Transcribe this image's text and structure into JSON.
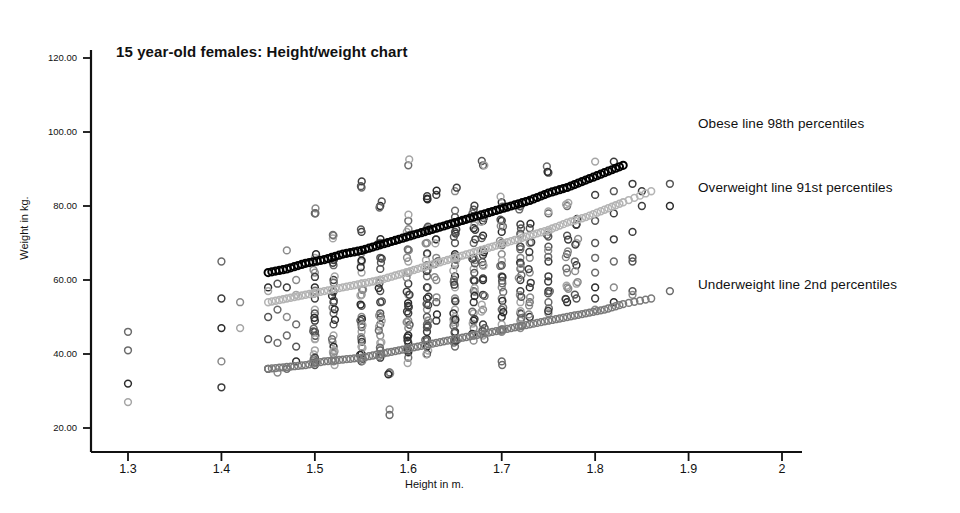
{
  "chart_data": {
    "type": "scatter",
    "title": "15 year-old females: Height/weight chart",
    "xlabel": "Height in m.",
    "ylabel": "Weight in kg.",
    "xlim": [
      1.25,
      2.02
    ],
    "ylim": [
      17.0,
      124.0
    ],
    "grid": false,
    "legend_position": "right-annotations",
    "xticks": [
      "1.3",
      "1.4",
      "1.5",
      "1.6",
      "1.7",
      "1.8",
      "1.9",
      "2"
    ],
    "xtick_values": [
      1.3,
      1.4,
      1.5,
      1.6,
      1.7,
      1.8,
      1.9,
      2.0
    ],
    "yticks": [
      "20.00",
      "40.00",
      "60.00",
      "80.00",
      "100.00",
      "120.00"
    ],
    "ytick_values": [
      20,
      40,
      60,
      80,
      100,
      120
    ],
    "marker": "open-circle",
    "annotations": [
      {
        "text": "Obese line 98th percentiles",
        "series": "obese-98th"
      },
      {
        "text": "Overweight line 91st percentiles",
        "series": "overweight-91st"
      },
      {
        "text": "Underweight line 2nd percentiles",
        "series": "underweight-2nd"
      }
    ],
    "series": [
      {
        "name": "observations",
        "role": "data-points",
        "color": "#3a3a3a",
        "points": [
          [
            1.3,
            46
          ],
          [
            1.3,
            41
          ],
          [
            1.3,
            32
          ],
          [
            1.3,
            27
          ],
          [
            1.4,
            65
          ],
          [
            1.4,
            55
          ],
          [
            1.4,
            47
          ],
          [
            1.4,
            38
          ],
          [
            1.4,
            31
          ],
          [
            1.42,
            54
          ],
          [
            1.42,
            47
          ],
          [
            1.45,
            58
          ],
          [
            1.45,
            57
          ],
          [
            1.45,
            50
          ],
          [
            1.45,
            44
          ],
          [
            1.45,
            36
          ],
          [
            1.46,
            59
          ],
          [
            1.46,
            52
          ],
          [
            1.46,
            43
          ],
          [
            1.46,
            35
          ],
          [
            1.47,
            68
          ],
          [
            1.47,
            58
          ],
          [
            1.47,
            50
          ],
          [
            1.47,
            45
          ],
          [
            1.47,
            36
          ],
          [
            1.48,
            60
          ],
          [
            1.48,
            56
          ],
          [
            1.48,
            48
          ],
          [
            1.48,
            42
          ],
          [
            1.48,
            38
          ],
          [
            1.5,
            78
          ],
          [
            1.5,
            66
          ],
          [
            1.5,
            62
          ],
          [
            1.5,
            58
          ],
          [
            1.5,
            55
          ],
          [
            1.5,
            52
          ],
          [
            1.5,
            49
          ],
          [
            1.5,
            46
          ],
          [
            1.5,
            44
          ],
          [
            1.5,
            41
          ],
          [
            1.5,
            39
          ],
          [
            1.5,
            37
          ],
          [
            1.52,
            72
          ],
          [
            1.52,
            64
          ],
          [
            1.52,
            60
          ],
          [
            1.52,
            57
          ],
          [
            1.52,
            54
          ],
          [
            1.52,
            51
          ],
          [
            1.52,
            48
          ],
          [
            1.52,
            45
          ],
          [
            1.52,
            42
          ],
          [
            1.52,
            40
          ],
          [
            1.52,
            38
          ],
          [
            1.55,
            85
          ],
          [
            1.55,
            73
          ],
          [
            1.55,
            68
          ],
          [
            1.55,
            65
          ],
          [
            1.55,
            62
          ],
          [
            1.55,
            59
          ],
          [
            1.55,
            56
          ],
          [
            1.55,
            53
          ],
          [
            1.55,
            50
          ],
          [
            1.55,
            48
          ],
          [
            1.55,
            46
          ],
          [
            1.55,
            44
          ],
          [
            1.55,
            42
          ],
          [
            1.55,
            40
          ],
          [
            1.55,
            38
          ],
          [
            1.57,
            80
          ],
          [
            1.57,
            70
          ],
          [
            1.57,
            66
          ],
          [
            1.57,
            63
          ],
          [
            1.57,
            60
          ],
          [
            1.57,
            57
          ],
          [
            1.57,
            54
          ],
          [
            1.57,
            51
          ],
          [
            1.57,
            48
          ],
          [
            1.57,
            45
          ],
          [
            1.57,
            43
          ],
          [
            1.57,
            41
          ],
          [
            1.57,
            39
          ],
          [
            1.58,
            25
          ],
          [
            1.58,
            35
          ],
          [
            1.6,
            91
          ],
          [
            1.6,
            76
          ],
          [
            1.6,
            72
          ],
          [
            1.6,
            68
          ],
          [
            1.6,
            65
          ],
          [
            1.6,
            62
          ],
          [
            1.6,
            59
          ],
          [
            1.6,
            56
          ],
          [
            1.6,
            53
          ],
          [
            1.6,
            51
          ],
          [
            1.6,
            49
          ],
          [
            1.6,
            47
          ],
          [
            1.6,
            45
          ],
          [
            1.6,
            43
          ],
          [
            1.6,
            41
          ],
          [
            1.6,
            39
          ],
          [
            1.62,
            82
          ],
          [
            1.62,
            74
          ],
          [
            1.62,
            70
          ],
          [
            1.62,
            67
          ],
          [
            1.62,
            64
          ],
          [
            1.62,
            61
          ],
          [
            1.62,
            58
          ],
          [
            1.62,
            55
          ],
          [
            1.62,
            52
          ],
          [
            1.62,
            50
          ],
          [
            1.62,
            48
          ],
          [
            1.62,
            46
          ],
          [
            1.62,
            44
          ],
          [
            1.62,
            42
          ],
          [
            1.62,
            40
          ],
          [
            1.63,
            83
          ],
          [
            1.63,
            71
          ],
          [
            1.63,
            66
          ],
          [
            1.63,
            60
          ],
          [
            1.63,
            54
          ],
          [
            1.63,
            49
          ],
          [
            1.65,
            84
          ],
          [
            1.65,
            77
          ],
          [
            1.65,
            73
          ],
          [
            1.65,
            70
          ],
          [
            1.65,
            67
          ],
          [
            1.65,
            64
          ],
          [
            1.65,
            61
          ],
          [
            1.65,
            58
          ],
          [
            1.65,
            55
          ],
          [
            1.65,
            52
          ],
          [
            1.65,
            50
          ],
          [
            1.65,
            48
          ],
          [
            1.65,
            46
          ],
          [
            1.65,
            44
          ],
          [
            1.65,
            42
          ],
          [
            1.67,
            79
          ],
          [
            1.67,
            74
          ],
          [
            1.67,
            70
          ],
          [
            1.67,
            66
          ],
          [
            1.67,
            63
          ],
          [
            1.67,
            60
          ],
          [
            1.67,
            57
          ],
          [
            1.67,
            54
          ],
          [
            1.67,
            51
          ],
          [
            1.67,
            49
          ],
          [
            1.67,
            47
          ],
          [
            1.67,
            45
          ],
          [
            1.68,
            91
          ],
          [
            1.68,
            76
          ],
          [
            1.68,
            72
          ],
          [
            1.68,
            68
          ],
          [
            1.68,
            64
          ],
          [
            1.68,
            60
          ],
          [
            1.68,
            56
          ],
          [
            1.68,
            52
          ],
          [
            1.68,
            48
          ],
          [
            1.68,
            45
          ],
          [
            1.7,
            81
          ],
          [
            1.7,
            76
          ],
          [
            1.7,
            73
          ],
          [
            1.7,
            70
          ],
          [
            1.7,
            67
          ],
          [
            1.7,
            64
          ],
          [
            1.7,
            61
          ],
          [
            1.7,
            58
          ],
          [
            1.7,
            55
          ],
          [
            1.7,
            52
          ],
          [
            1.7,
            50
          ],
          [
            1.7,
            48
          ],
          [
            1.7,
            46
          ],
          [
            1.7,
            38
          ],
          [
            1.72,
            80
          ],
          [
            1.72,
            75
          ],
          [
            1.72,
            72
          ],
          [
            1.72,
            69
          ],
          [
            1.72,
            66
          ],
          [
            1.72,
            63
          ],
          [
            1.72,
            60
          ],
          [
            1.72,
            57
          ],
          [
            1.72,
            54
          ],
          [
            1.72,
            51
          ],
          [
            1.72,
            49
          ],
          [
            1.72,
            47
          ],
          [
            1.73,
            74
          ],
          [
            1.73,
            70
          ],
          [
            1.73,
            66
          ],
          [
            1.73,
            62
          ],
          [
            1.73,
            58
          ],
          [
            1.73,
            54
          ],
          [
            1.73,
            50
          ],
          [
            1.75,
            89
          ],
          [
            1.75,
            78
          ],
          [
            1.75,
            73
          ],
          [
            1.75,
            69
          ],
          [
            1.75,
            65
          ],
          [
            1.75,
            61
          ],
          [
            1.75,
            57
          ],
          [
            1.75,
            54
          ],
          [
            1.75,
            51
          ],
          [
            1.77,
            80
          ],
          [
            1.77,
            72
          ],
          [
            1.77,
            67
          ],
          [
            1.77,
            62
          ],
          [
            1.77,
            58
          ],
          [
            1.77,
            54
          ],
          [
            1.78,
            75
          ],
          [
            1.78,
            70
          ],
          [
            1.78,
            64
          ],
          [
            1.78,
            59
          ],
          [
            1.78,
            55
          ],
          [
            1.8,
            92
          ],
          [
            1.8,
            83
          ],
          [
            1.8,
            76
          ],
          [
            1.8,
            70
          ],
          [
            1.8,
            66
          ],
          [
            1.8,
            62
          ],
          [
            1.8,
            58
          ],
          [
            1.8,
            55
          ],
          [
            1.8,
            52
          ],
          [
            1.82,
            92
          ],
          [
            1.82,
            84
          ],
          [
            1.82,
            78
          ],
          [
            1.82,
            71
          ],
          [
            1.82,
            65
          ],
          [
            1.82,
            58
          ],
          [
            1.82,
            54
          ],
          [
            1.84,
            86
          ],
          [
            1.84,
            73
          ],
          [
            1.84,
            66
          ],
          [
            1.84,
            65
          ],
          [
            1.84,
            57
          ],
          [
            1.84,
            56
          ],
          [
            1.85,
            84
          ],
          [
            1.85,
            80
          ],
          [
            1.88,
            86
          ],
          [
            1.88,
            80
          ],
          [
            1.88,
            57
          ]
        ]
      },
      {
        "name": "obese-98th",
        "role": "reference-line",
        "color": "#000000",
        "label": "Obese line 98th percentiles",
        "percentile": 98,
        "points": [
          [
            1.45,
            62
          ],
          [
            1.47,
            63
          ],
          [
            1.49,
            64.5
          ],
          [
            1.51,
            65.5
          ],
          [
            1.53,
            67
          ],
          [
            1.55,
            68
          ],
          [
            1.57,
            69.5
          ],
          [
            1.59,
            71
          ],
          [
            1.61,
            72.5
          ],
          [
            1.63,
            74
          ],
          [
            1.65,
            75.5
          ],
          [
            1.67,
            77
          ],
          [
            1.69,
            78.5
          ],
          [
            1.71,
            80
          ],
          [
            1.73,
            81.5
          ],
          [
            1.75,
            83.5
          ],
          [
            1.77,
            85
          ],
          [
            1.79,
            87
          ],
          [
            1.81,
            89
          ],
          [
            1.83,
            91
          ]
        ]
      },
      {
        "name": "overweight-91st",
        "role": "reference-line",
        "color": "#b4b4b4",
        "label": "Overweight line 91st percentiles",
        "percentile": 91,
        "points": [
          [
            1.45,
            54
          ],
          [
            1.47,
            55
          ],
          [
            1.49,
            56
          ],
          [
            1.51,
            57
          ],
          [
            1.53,
            58
          ],
          [
            1.55,
            59
          ],
          [
            1.57,
            60
          ],
          [
            1.59,
            61.5
          ],
          [
            1.61,
            63
          ],
          [
            1.63,
            64.5
          ],
          [
            1.65,
            66
          ],
          [
            1.67,
            67.5
          ],
          [
            1.69,
            69
          ],
          [
            1.71,
            70.5
          ],
          [
            1.73,
            72
          ],
          [
            1.75,
            73.5
          ],
          [
            1.77,
            75.5
          ],
          [
            1.79,
            77
          ],
          [
            1.81,
            79
          ],
          [
            1.83,
            81
          ],
          [
            1.86,
            84
          ]
        ]
      },
      {
        "name": "underweight-2nd",
        "role": "reference-line",
        "color": "#7a7a7a",
        "label": "Underweight line 2nd percentiles",
        "percentile": 2,
        "points": [
          [
            1.45,
            36
          ],
          [
            1.47,
            36.5
          ],
          [
            1.49,
            37
          ],
          [
            1.51,
            38
          ],
          [
            1.53,
            38.5
          ],
          [
            1.55,
            39
          ],
          [
            1.57,
            40
          ],
          [
            1.59,
            41
          ],
          [
            1.61,
            42
          ],
          [
            1.63,
            43
          ],
          [
            1.65,
            44
          ],
          [
            1.67,
            45
          ],
          [
            1.69,
            46
          ],
          [
            1.71,
            47
          ],
          [
            1.73,
            48
          ],
          [
            1.75,
            49
          ],
          [
            1.77,
            50
          ],
          [
            1.79,
            51
          ],
          [
            1.81,
            52
          ],
          [
            1.83,
            53.5
          ],
          [
            1.86,
            55
          ]
        ]
      }
    ]
  },
  "axes": {
    "y_axis_name": "y-axis",
    "x_axis_name": "x-axis"
  }
}
